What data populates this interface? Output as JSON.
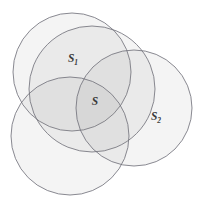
{
  "diagram": {
    "type": "venn",
    "canvas": {
      "width": 203,
      "height": 203,
      "background": "#ffffff"
    },
    "style": {
      "fill_color": "#7d7d7d",
      "fill_opacity": 0.085,
      "stroke_color": "#6e6e78",
      "stroke_width": 0.85,
      "label_color": "#3a3a3a"
    },
    "circles": [
      {
        "id": "circle-top-left",
        "name": "top-left-circle",
        "cx": 72,
        "cy": 72,
        "r": 59,
        "label": ""
      },
      {
        "id": "circle-s1",
        "name": "s1-circle",
        "cx": 92,
        "cy": 89,
        "r": 63,
        "label": "S",
        "subscript": "1"
      },
      {
        "id": "circle-s2",
        "name": "s2-circle",
        "cx": 134,
        "cy": 108,
        "r": 58,
        "label": "S",
        "subscript": "2"
      },
      {
        "id": "circle-bottom-left",
        "name": "bottom-left-circle",
        "cx": 70,
        "cy": 136,
        "r": 59,
        "label": ""
      }
    ],
    "labels": [
      {
        "id": "label-s1",
        "name": "label-s1",
        "text": "S",
        "subscript": "1",
        "x": 73,
        "y": 62
      },
      {
        "id": "label-s",
        "name": "label-s",
        "text": "S",
        "subscript": "",
        "x": 95,
        "y": 105
      },
      {
        "id": "label-s2",
        "name": "label-s2",
        "text": "S",
        "subscript": "2",
        "x": 156,
        "y": 120
      }
    ]
  }
}
